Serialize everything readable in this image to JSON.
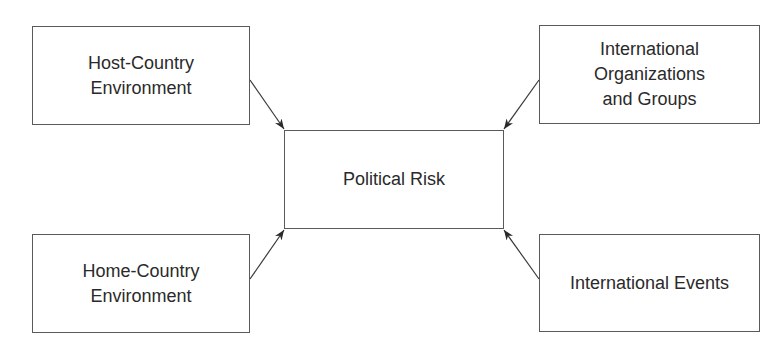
{
  "diagram": {
    "center": {
      "label": "Political Risk"
    },
    "sources": [
      {
        "id": "host",
        "label": "Host-Country\nEnvironment",
        "position": "top-left"
      },
      {
        "id": "orgs",
        "label": "International\nOrganizations\nand Groups",
        "position": "top-right"
      },
      {
        "id": "home",
        "label": "Home-Country\nEnvironment",
        "position": "bottom-left"
      },
      {
        "id": "events",
        "label": "International Events",
        "position": "bottom-right"
      }
    ],
    "edges": [
      {
        "from": "Host-Country Environment",
        "to": "Political Risk"
      },
      {
        "from": "International Organizations and Groups",
        "to": "Political Risk"
      },
      {
        "from": "Home-Country Environment",
        "to": "Political Risk"
      },
      {
        "from": "International Events",
        "to": "Political Risk"
      }
    ],
    "colors": {
      "line": "#3a3a3a",
      "border": "#5a5a5a",
      "text": "#2a2a2a"
    }
  }
}
